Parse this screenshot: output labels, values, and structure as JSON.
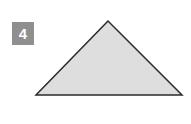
{
  "figure": {
    "label": "4",
    "shape": "obtuse-triangle",
    "fill": "#dedede",
    "stroke": "#2a2a2a",
    "badge_color": "#8f8f8f",
    "vertices": [
      [
        108,
        21
      ],
      [
        36,
        95
      ],
      [
        182,
        95
      ]
    ]
  }
}
